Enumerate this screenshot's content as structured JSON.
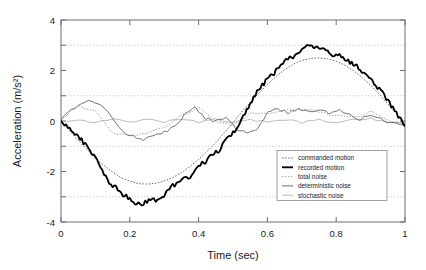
{
  "chart_data": {
    "type": "line",
    "title": "",
    "xlabel": "Time (sec)",
    "ylabel": "Acceleration (m/s²)",
    "xlim": [
      0,
      1
    ],
    "ylim": [
      -4,
      4
    ],
    "xticks": [
      0,
      0.2,
      0.4,
      0.6,
      0.8,
      1
    ],
    "xtick_labels": [
      "0",
      "0.2",
      "0.4",
      "0.6",
      "0.8",
      "1"
    ],
    "yticks": [
      -4,
      -2,
      0,
      2,
      4
    ],
    "ytick_labels": [
      "-4",
      "-2",
      "0",
      "2",
      "4"
    ],
    "minor_yticks": [
      -3,
      -1,
      1,
      3
    ],
    "grid": "horizontal dotted gridlines at -3, -1, 1, 3",
    "legend_position": "lower right inside axes",
    "series": [
      {
        "name": "commanded motion",
        "style": "dotted",
        "color": "#4a4a4a",
        "x": [
          0,
          0.025,
          0.05,
          0.075,
          0.1,
          0.125,
          0.15,
          0.175,
          0.2,
          0.225,
          0.25,
          0.275,
          0.3,
          0.325,
          0.35,
          0.375,
          0.4,
          0.425,
          0.45,
          0.475,
          0.5,
          0.525,
          0.55,
          0.575,
          0.6,
          0.625,
          0.65,
          0.675,
          0.7,
          0.725,
          0.75,
          0.775,
          0.8,
          0.825,
          0.85,
          0.875,
          0.9,
          0.925,
          0.95,
          0.975,
          1.0
        ],
        "values": [
          0,
          -0.39,
          -0.77,
          -1.12,
          -1.47,
          -1.77,
          -2.02,
          -2.25,
          -2.38,
          -2.48,
          -2.5,
          -2.47,
          -2.38,
          -2.24,
          -2.05,
          -1.8,
          -1.52,
          -1.2,
          -0.85,
          -0.46,
          -0.06,
          0.35,
          0.73,
          1.1,
          1.45,
          1.76,
          2.03,
          2.25,
          2.4,
          2.48,
          2.5,
          2.46,
          2.37,
          2.21,
          2.0,
          1.73,
          1.42,
          1.06,
          0.68,
          0.3,
          -0.1
        ]
      },
      {
        "name": "recorded motion",
        "style": "thick solid",
        "color": "#000000",
        "x": [
          0,
          0.02,
          0.04,
          0.06,
          0.08,
          0.1,
          0.12,
          0.14,
          0.16,
          0.18,
          0.2,
          0.22,
          0.24,
          0.26,
          0.28,
          0.3,
          0.32,
          0.34,
          0.36,
          0.38,
          0.4,
          0.42,
          0.44,
          0.46,
          0.48,
          0.5,
          0.52,
          0.54,
          0.56,
          0.58,
          0.6,
          0.62,
          0.64,
          0.66,
          0.68,
          0.7,
          0.72,
          0.74,
          0.76,
          0.78,
          0.8,
          0.82,
          0.84,
          0.86,
          0.88,
          0.9,
          0.92,
          0.94,
          0.96,
          0.98,
          1.0
        ],
        "values": [
          0.05,
          -0.25,
          -0.5,
          -0.75,
          -1.1,
          -1.45,
          -1.9,
          -2.5,
          -2.65,
          -2.9,
          -3.05,
          -3.3,
          -3.25,
          -3.1,
          -3.15,
          -2.95,
          -2.6,
          -2.45,
          -2.3,
          -2.15,
          -1.75,
          -1.6,
          -1.35,
          -1.15,
          -0.75,
          -0.45,
          -0.1,
          0.45,
          0.95,
          1.3,
          1.7,
          1.9,
          2.25,
          2.45,
          2.6,
          2.85,
          3.0,
          2.85,
          2.9,
          2.65,
          2.6,
          2.55,
          2.3,
          2.15,
          1.9,
          1.65,
          1.35,
          1.0,
          0.6,
          0.2,
          -0.2
        ]
      },
      {
        "name": "total noise",
        "style": "dotted light",
        "color": "#8a8a8a",
        "x": [
          0,
          0.05,
          0.1,
          0.15,
          0.2,
          0.25,
          0.3,
          0.35,
          0.4,
          0.45,
          0.5,
          0.55,
          0.6,
          0.65,
          0.7,
          0.75,
          0.8,
          0.85,
          0.9,
          0.95,
          1.0
        ],
        "values": [
          0.05,
          0.6,
          0.35,
          -0.45,
          -0.6,
          -0.45,
          -0.25,
          0.2,
          0.5,
          0.0,
          -0.15,
          0.3,
          0.3,
          0.4,
          0.5,
          0.35,
          0.2,
          0.15,
          0.35,
          0.0,
          -0.1
        ]
      },
      {
        "name": "deterministic noise",
        "style": "solid medium",
        "color": "#555555",
        "x": [
          0,
          0.03,
          0.06,
          0.09,
          0.12,
          0.15,
          0.18,
          0.21,
          0.24,
          0.27,
          0.3,
          0.33,
          0.36,
          0.39,
          0.42,
          0.45,
          0.48,
          0.51,
          0.54,
          0.57,
          0.6,
          0.63,
          0.66,
          0.69,
          0.72,
          0.75,
          0.78,
          0.81,
          0.84,
          0.87,
          0.9,
          0.93,
          0.96,
          1.0
        ],
        "values": [
          0.05,
          0.45,
          0.72,
          0.78,
          0.6,
          0.1,
          -0.45,
          -0.6,
          -0.72,
          -0.6,
          -0.45,
          -0.2,
          0.25,
          0.55,
          0.1,
          0.0,
          0.1,
          -0.3,
          -0.5,
          -0.35,
          0.3,
          0.5,
          0.3,
          0.5,
          0.35,
          0.45,
          0.3,
          0.4,
          0.25,
          0.05,
          0.25,
          0.1,
          -0.1,
          -0.15
        ]
      },
      {
        "name": "stochastic noise",
        "style": "solid light",
        "color": "#a8a8a8",
        "x": [
          0,
          0.05,
          0.1,
          0.15,
          0.2,
          0.25,
          0.3,
          0.35,
          0.4,
          0.45,
          0.5,
          0.55,
          0.6,
          0.65,
          0.7,
          0.75,
          0.8,
          0.85,
          0.9,
          0.95,
          1.0
        ],
        "values": [
          0.0,
          0.05,
          -0.05,
          0.08,
          -0.06,
          0.05,
          -0.04,
          0.07,
          -0.05,
          0.06,
          -0.07,
          0.05,
          -0.04,
          0.06,
          -0.05,
          0.04,
          -0.06,
          0.05,
          0.1,
          -0.05,
          -0.1
        ]
      }
    ]
  },
  "legend": {
    "entries": [
      {
        "label": "commanded motion"
      },
      {
        "label": "recorded motion"
      },
      {
        "label": "total noise"
      },
      {
        "label": "deterministic noise"
      },
      {
        "label": "stochastic noise"
      }
    ]
  }
}
